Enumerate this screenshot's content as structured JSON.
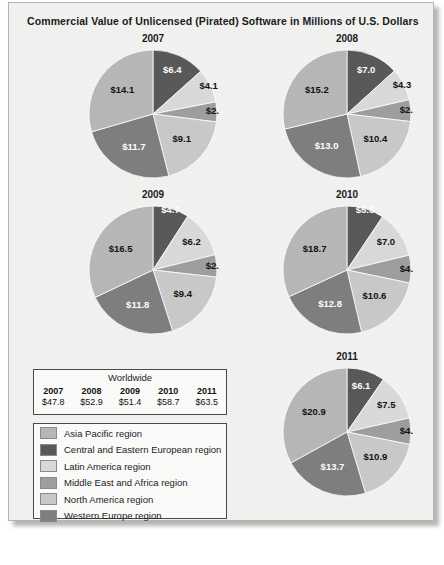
{
  "title": "Commercial Value of Unlicensed (Pirated) Software in Millions of U.S. Dollars",
  "worldwide": {
    "caption": "Worldwide",
    "years": [
      "2007",
      "2008",
      "2009",
      "2010",
      "2011"
    ],
    "values": [
      "$47.8",
      "$52.9",
      "$51.4",
      "$58.7",
      "$63.5"
    ]
  },
  "legend": [
    {
      "label": "Asia Pacific region",
      "color": "#b7b7b7"
    },
    {
      "label": "Central and Eastern European region",
      "color": "#585858"
    },
    {
      "label": "Latin America region",
      "color": "#dadada"
    },
    {
      "label": "Middle East and Africa region",
      "color": "#9e9e9e"
    },
    {
      "label": "North America region",
      "color": "#c9c9c9"
    },
    {
      "label": "Western Europe region",
      "color": "#7e7e7e"
    }
  ],
  "chart_data": {
    "type": "pie",
    "title": "Commercial Value of Unlicensed (Pirated) Software in Millions of U.S. Dollars",
    "unit": "Billions of U.S. Dollars (labels as shown)",
    "categories": [
      "Central and Eastern European region",
      "Latin America region",
      "Middle East and Africa region",
      "North America region",
      "Western Europe region",
      "Asia Pacific region"
    ],
    "colors": [
      "#585858",
      "#dadada",
      "#9e9e9e",
      "#c9c9c9",
      "#7e7e7e",
      "#b7b7b7"
    ],
    "legend_position": "bottom-left",
    "charts": [
      {
        "year": "2007",
        "labels": [
          "$6.4",
          "$4.1",
          "$2.4",
          "$9.1",
          "$11.7",
          "$14.1"
        ],
        "values": [
          6.4,
          4.1,
          2.4,
          9.1,
          11.7,
          14.1
        ],
        "total": 47.8
      },
      {
        "year": "2008",
        "labels": [
          "$7.0",
          "$4.3",
          "$2.9",
          "$10.4",
          "$13.0",
          "$15.2"
        ],
        "values": [
          7.0,
          4.3,
          2.9,
          10.4,
          13.0,
          15.2
        ],
        "total": 52.9
      },
      {
        "year": "2009",
        "labels": [
          "$4.7",
          "$6.2",
          "$2.9",
          "$9.4",
          "$11.8",
          "$16.5"
        ],
        "values": [
          4.7,
          6.2,
          2.9,
          9.4,
          11.8,
          16.5
        ],
        "total": 51.4
      },
      {
        "year": "2010",
        "labels": [
          "$5.5",
          "$7.0",
          "$4.1",
          "$10.6",
          "$12.8",
          "$18.7"
        ],
        "values": [
          5.5,
          7.0,
          4.1,
          10.6,
          12.8,
          18.7
        ],
        "total": 58.7
      },
      {
        "year": "2011",
        "labels": [
          "$6.1",
          "$7.5",
          "$4.2",
          "$10.9",
          "$13.7",
          "$20.9"
        ],
        "values": [
          6.1,
          7.5,
          4.2,
          10.9,
          13.7,
          20.9
        ],
        "total": 63.5
      }
    ]
  },
  "layout": {
    "pies": [
      {
        "year": "2007",
        "left": 78,
        "top": 30,
        "size": 132
      },
      {
        "year": "2008",
        "left": 272,
        "top": 30,
        "size": 132
      },
      {
        "year": "2009",
        "left": 78,
        "top": 186,
        "size": 132
      },
      {
        "year": "2010",
        "left": 272,
        "top": 186,
        "size": 132
      },
      {
        "year": "2011",
        "left": 272,
        "top": 348,
        "size": 132
      }
    ]
  }
}
